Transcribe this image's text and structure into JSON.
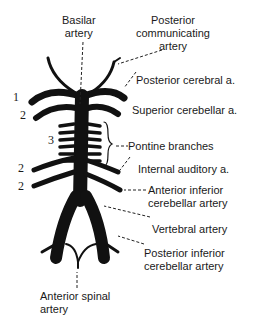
{
  "diagram": {
    "labels": {
      "basilar": [
        "Basilar",
        "artery"
      ],
      "posterior_communicating": [
        "Posterior",
        "communicating",
        "artery"
      ],
      "posterior_cerebral": "Posterior cerebral a.",
      "superior_cerebellar": "Superior cerebellar a.",
      "pontine": "Pontine branches",
      "internal_auditory": "Internal auditory a.",
      "anterior_inferior_cerebellar": [
        "Anterior inferior",
        "cerebellar artery"
      ],
      "vertebral": "Vertebral artery",
      "posterior_inferior_cerebellar": [
        "Posterior inferior",
        "cerebellar artery"
      ],
      "anterior_spinal": [
        "Anterior spinal",
        "artery"
      ]
    },
    "numbers": {
      "n1": "1",
      "n2a": "2",
      "n3": "3",
      "n2b": "2",
      "n2c": "2"
    },
    "colors": {
      "artery": "#111111",
      "text": "#1a1a1a",
      "background": "#ffffff"
    }
  }
}
